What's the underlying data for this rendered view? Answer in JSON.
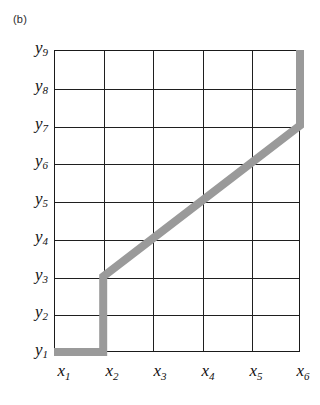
{
  "figure": {
    "panel_label": "(b)",
    "caption_position": "top-left"
  },
  "style": {
    "path_color": "#9a9a9a",
    "grid_color": "#1f1f1f",
    "border_color": "#1a1a1a",
    "background": "#ffffff",
    "text_color": "#111111",
    "path_width_px": 8
  },
  "axes": {
    "x": {
      "label": "",
      "ticks": [
        {
          "base": "x",
          "sub": "1"
        },
        {
          "base": "x",
          "sub": "2"
        },
        {
          "base": "x",
          "sub": "3"
        },
        {
          "base": "x",
          "sub": "4"
        },
        {
          "base": "x",
          "sub": "5"
        },
        {
          "base": "x",
          "sub": "6"
        }
      ]
    },
    "y": {
      "label": "",
      "ticks": [
        {
          "base": "y",
          "sub": "9"
        },
        {
          "base": "y",
          "sub": "8"
        },
        {
          "base": "y",
          "sub": "7"
        },
        {
          "base": "y",
          "sub": "6"
        },
        {
          "base": "y",
          "sub": "5"
        },
        {
          "base": "y",
          "sub": "4"
        },
        {
          "base": "y",
          "sub": "3"
        },
        {
          "base": "y",
          "sub": "2"
        },
        {
          "base": "y",
          "sub": "1"
        }
      ]
    }
  },
  "chart_data": {
    "type": "line",
    "title": "(b)",
    "xlabel": "",
    "ylabel": "",
    "grid": true,
    "legend": null,
    "xlim": [
      "x1",
      "x6"
    ],
    "ylim": [
      "y1",
      "y9"
    ],
    "x_tick_labels": [
      "x1",
      "x2",
      "x3",
      "x4",
      "x5",
      "x6"
    ],
    "y_tick_labels": [
      "y1",
      "y2",
      "y3",
      "y4",
      "y5",
      "y6",
      "y7",
      "y8",
      "y9"
    ],
    "x_index_values": [
      1,
      2,
      3,
      4,
      5,
      6
    ],
    "y_index_values": [
      1,
      2,
      3,
      4,
      5,
      6,
      7,
      8,
      9
    ],
    "series": [
      {
        "name": "monotonic warping path",
        "color": "#9a9a9a",
        "style": "thick-step-diagonal",
        "points": [
          {
            "x": "x1",
            "y": "y1",
            "xi": 1,
            "yi": 1
          },
          {
            "x": "x2",
            "y": "y1",
            "xi": 2,
            "yi": 1
          },
          {
            "x": "x2",
            "y": "y3",
            "xi": 2,
            "yi": 3
          },
          {
            "x": "x3",
            "y": "y4",
            "xi": 3,
            "yi": 4
          },
          {
            "x": "x4",
            "y": "y5",
            "xi": 4,
            "yi": 5
          },
          {
            "x": "x5",
            "y": "y6",
            "xi": 5,
            "yi": 6
          },
          {
            "x": "x6",
            "y": "y7",
            "xi": 6,
            "yi": 7
          },
          {
            "x": "x6",
            "y": "y9",
            "xi": 6,
            "yi": 9
          }
        ]
      }
    ]
  }
}
